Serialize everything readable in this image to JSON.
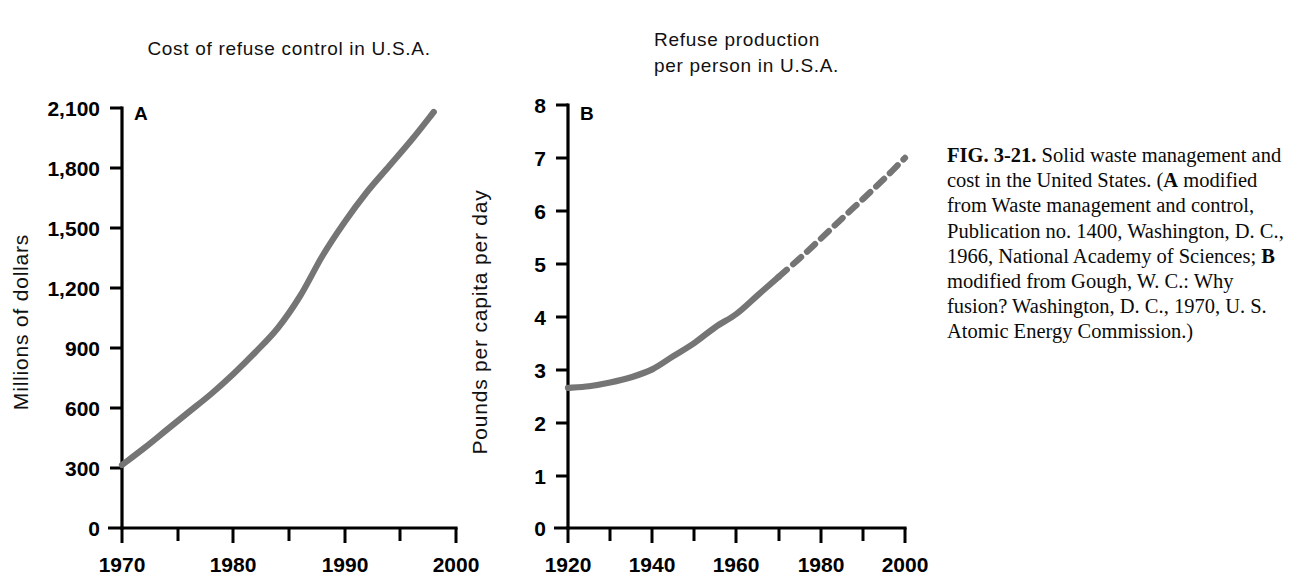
{
  "figure": {
    "caption_label": "FIG. 3-21.",
    "caption_text": " Solid waste management and cost in the United States. (",
    "caption_a_marker": "A",
    "caption_a_text": " modified from Waste management and control, Publication no. 1400, Washington, D. C., 1966, National Academy of Sciences; ",
    "caption_b_marker": "B",
    "caption_b_text": " modified from Gough, W. C.: Why fusion? Washington, D. C., 1970, U. S. Atomic Energy Commission.)",
    "curve_color": "#757575",
    "axis_color": "#000000",
    "background_color": "#ffffff"
  },
  "chart_data": [
    {
      "type": "line",
      "panel": "A",
      "title": "Cost of refuse control in U.S.A.",
      "xlabel": "",
      "ylabel": "Millions of dollars",
      "xlim": [
        1970,
        2000
      ],
      "ylim": [
        0,
        2100
      ],
      "xticks": [
        1970,
        1980,
        1990,
        2000
      ],
      "xtick_labels": [
        "1970",
        "1980",
        "1990",
        "2000"
      ],
      "xminor_step": 5,
      "yticks": [
        0,
        300,
        600,
        900,
        1200,
        1500,
        1800,
        2100
      ],
      "ytick_labels": [
        "0",
        "300",
        "600",
        "900",
        "1,200",
        "1,500",
        "1,800",
        "2,100"
      ],
      "grid": false,
      "legend": "none",
      "series": [
        {
          "name": "Cost of refuse control",
          "style": "solid",
          "x": [
            1970,
            1972,
            1974,
            1976,
            1978,
            1980,
            1982,
            1984,
            1986,
            1988,
            1990,
            1992,
            1994,
            1996,
            1998
          ],
          "y": [
            315,
            400,
            490,
            580,
            670,
            770,
            880,
            1000,
            1160,
            1360,
            1530,
            1680,
            1810,
            1940,
            2080
          ]
        }
      ]
    },
    {
      "type": "line",
      "panel": "B",
      "title": "Refuse production per person in U.S.A.",
      "title_line_1": "Refuse production",
      "title_line_2": "per person in U.S.A.",
      "xlabel": "",
      "ylabel": "Pounds per capita per day",
      "xlim": [
        1920,
        2000
      ],
      "ylim": [
        0,
        8
      ],
      "xticks": [
        1920,
        1940,
        1960,
        1980,
        2000
      ],
      "xtick_labels": [
        "1920",
        "1940",
        "1960",
        "1980",
        "2000"
      ],
      "xminor_step": 10,
      "yticks": [
        0,
        1,
        2,
        3,
        4,
        5,
        6,
        7,
        8
      ],
      "ytick_labels": [
        "0",
        "1",
        "2",
        "3",
        "4",
        "5",
        "6",
        "7",
        "8"
      ],
      "grid": false,
      "legend": "none",
      "series": [
        {
          "name": "Refuse production (observed)",
          "style": "solid",
          "x": [
            1920,
            1925,
            1930,
            1935,
            1940,
            1945,
            1950,
            1955,
            1960,
            1965,
            1970
          ],
          "y": [
            2.65,
            2.68,
            2.75,
            2.85,
            3.0,
            3.25,
            3.5,
            3.8,
            4.05,
            4.4,
            4.75
          ]
        },
        {
          "name": "Refuse production (projected)",
          "style": "dashed",
          "x": [
            1970,
            1975,
            1980,
            1985,
            1990,
            1995,
            2000
          ],
          "y": [
            4.75,
            5.1,
            5.47,
            5.85,
            6.22,
            6.6,
            7.0
          ]
        }
      ]
    }
  ]
}
